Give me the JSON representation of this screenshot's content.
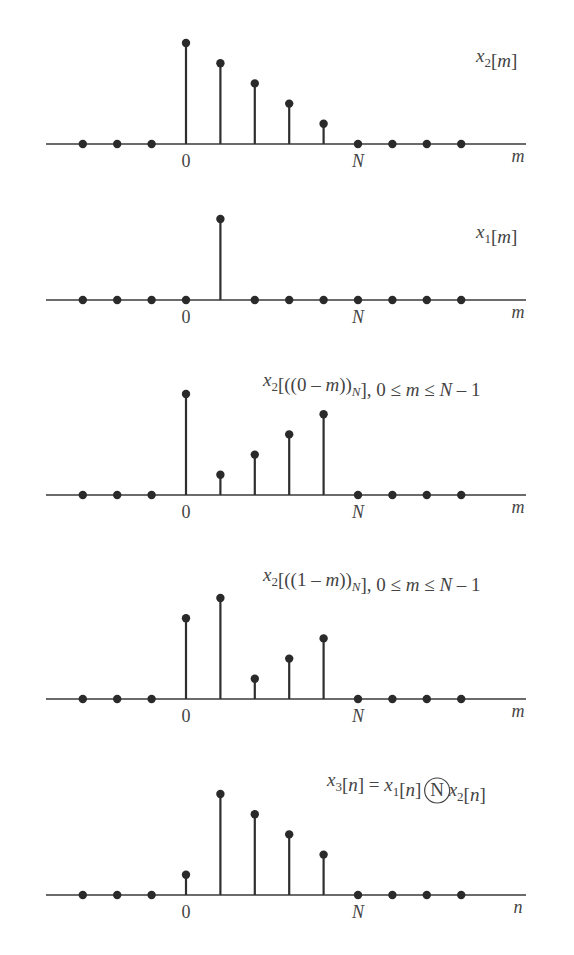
{
  "figure": {
    "colors": {
      "stem": "#2e2e2e",
      "axis": "#3a3a3a",
      "text": "#444444",
      "background": "#ffffff"
    }
  },
  "chart_data": [
    {
      "type": "stem",
      "title": "x2[m]",
      "label_parts": [
        {
          "t": "x",
          "style": "it"
        },
        {
          "t": "2",
          "style": "sub"
        },
        {
          "t": "[",
          "style": ""
        },
        {
          "t": "m",
          "style": "it"
        },
        {
          "t": "]",
          "style": ""
        }
      ],
      "xlabel": "m",
      "tick_labels": [
        {
          "at": 0,
          "text": "0"
        },
        {
          "at": 5,
          "text": "N"
        }
      ],
      "x": [
        -3,
        -2,
        -1,
        0,
        1,
        2,
        3,
        4,
        5,
        6,
        7,
        8
      ],
      "values": [
        0,
        0,
        0,
        5,
        4,
        3,
        2,
        1,
        0,
        0,
        0,
        0
      ],
      "N": 5,
      "axis_y": 144,
      "label_pos": {
        "x": 476,
        "y": 62
      }
    },
    {
      "type": "stem",
      "title": "x1[m]",
      "label_parts": [
        {
          "t": "x",
          "style": "it"
        },
        {
          "t": "1",
          "style": "sub"
        },
        {
          "t": "[",
          "style": ""
        },
        {
          "t": "m",
          "style": "it"
        },
        {
          "t": "]",
          "style": ""
        }
      ],
      "xlabel": "m",
      "tick_labels": [
        {
          "at": 0,
          "text": "0"
        },
        {
          "at": 5,
          "text": "N"
        }
      ],
      "x": [
        -3,
        -2,
        -1,
        0,
        1,
        2,
        3,
        4,
        5,
        6,
        7,
        8
      ],
      "values": [
        0,
        0,
        0,
        0,
        1,
        0,
        0,
        0,
        0,
        0,
        0,
        0
      ],
      "impulse_pixel_height": 81,
      "axis_y": 300,
      "label_pos": {
        "x": 476,
        "y": 238
      }
    },
    {
      "type": "stem",
      "title": "x2[((0 − m))N], 0 ≤ m ≤ N − 1",
      "label_parts": [
        {
          "t": "x",
          "style": "it"
        },
        {
          "t": "2",
          "style": "sub"
        },
        {
          "t": "[((0 – ",
          "style": ""
        },
        {
          "t": "m",
          "style": "it"
        },
        {
          "t": "))",
          "style": ""
        },
        {
          "t": "N",
          "style": "sub it"
        },
        {
          "t": "], 0 ≤ ",
          "style": ""
        },
        {
          "t": "m",
          "style": "it"
        },
        {
          "t": " ≤ ",
          "style": ""
        },
        {
          "t": "N",
          "style": "it"
        },
        {
          "t": " – 1",
          "style": ""
        }
      ],
      "xlabel": "m",
      "tick_labels": [
        {
          "at": 0,
          "text": "0"
        },
        {
          "at": 5,
          "text": "N"
        }
      ],
      "x": [
        -3,
        -2,
        -1,
        0,
        1,
        2,
        3,
        4,
        5,
        6,
        7,
        8
      ],
      "values": [
        0,
        0,
        0,
        5,
        1,
        2,
        3,
        4,
        0,
        0,
        0,
        0
      ],
      "axis_y": 495,
      "label_pos": {
        "x": 263,
        "y": 386
      }
    },
    {
      "type": "stem",
      "title": "x2[((1 − m))N], 0 ≤ m ≤ N − 1",
      "label_parts": [
        {
          "t": "x",
          "style": "it"
        },
        {
          "t": "2",
          "style": "sub"
        },
        {
          "t": "[((1 – ",
          "style": ""
        },
        {
          "t": "m",
          "style": "it"
        },
        {
          "t": "))",
          "style": ""
        },
        {
          "t": "N",
          "style": "sub it"
        },
        {
          "t": "], 0 ≤ ",
          "style": ""
        },
        {
          "t": "m",
          "style": "it"
        },
        {
          "t": " ≤ ",
          "style": ""
        },
        {
          "t": "N",
          "style": "it"
        },
        {
          "t": " – 1",
          "style": ""
        }
      ],
      "xlabel": "m",
      "tick_labels": [
        {
          "at": 0,
          "text": "0"
        },
        {
          "at": 5,
          "text": "N"
        }
      ],
      "x": [
        -3,
        -2,
        -1,
        0,
        1,
        2,
        3,
        4,
        5,
        6,
        7,
        8
      ],
      "values": [
        0,
        0,
        0,
        4,
        5,
        1,
        2,
        3,
        0,
        0,
        0,
        0
      ],
      "axis_y": 699,
      "label_pos": {
        "x": 263,
        "y": 581
      }
    },
    {
      "type": "stem",
      "title": "x3[n] = x1[n] (N) x2[n]",
      "label_parts": [
        {
          "t": "x",
          "style": "it"
        },
        {
          "t": "3",
          "style": "sub"
        },
        {
          "t": "[",
          "style": ""
        },
        {
          "t": "n",
          "style": "it"
        },
        {
          "t": "] = ",
          "style": ""
        },
        {
          "t": "x",
          "style": "it"
        },
        {
          "t": "1",
          "style": "sub"
        },
        {
          "t": "[",
          "style": ""
        },
        {
          "t": "n",
          "style": "it"
        },
        {
          "t": "] ",
          "style": ""
        },
        {
          "t": "N",
          "style": "circled"
        },
        {
          "t": " x",
          "style": "it"
        },
        {
          "t": "2",
          "style": "sub"
        },
        {
          "t": "[",
          "style": ""
        },
        {
          "t": "n",
          "style": "it"
        },
        {
          "t": "]",
          "style": ""
        }
      ],
      "xlabel": "n",
      "tick_labels": [
        {
          "at": 0,
          "text": "0"
        },
        {
          "at": 5,
          "text": "N"
        }
      ],
      "x": [
        -3,
        -2,
        -1,
        0,
        1,
        2,
        3,
        4,
        5,
        6,
        7,
        8
      ],
      "values": [
        0,
        0,
        0,
        1,
        5,
        4,
        3,
        2,
        0,
        0,
        0,
        0
      ],
      "axis_y": 895,
      "label_pos": {
        "x": 327,
        "y": 786
      }
    }
  ],
  "layout": {
    "axis_x_start": 46,
    "axis_x_end": 526,
    "origin_x": 186,
    "sample_spacing": 34.4,
    "unit_height": 20.2,
    "dot_radius": 4.2,
    "xlabel_x": 518,
    "tick_offset_y": 20
  }
}
